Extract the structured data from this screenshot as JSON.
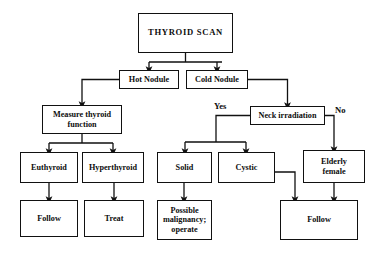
{
  "diagram": {
    "background_color": "#ffffff",
    "line_color": "#111111",
    "text_color": "#0d0d0d",
    "nodes": [
      {
        "id": "thyroid_scan",
        "label": "THYROID SCAN",
        "x": 138,
        "y": 13,
        "w": 95,
        "h": 40,
        "font_size": 8.6,
        "letter_spacing": 0.7
      },
      {
        "id": "hot_nodule",
        "label": "Hot Nodule",
        "x": 119,
        "y": 70,
        "w": 60,
        "h": 19,
        "font_size": 8.2,
        "letter_spacing": 0
      },
      {
        "id": "cold_nodule",
        "label": "Cold Nodule",
        "x": 186,
        "y": 70,
        "w": 62,
        "h": 19,
        "font_size": 8.2,
        "letter_spacing": 0
      },
      {
        "id": "measure_thyroid",
        "label": "Measure thyroid\nfunction",
        "x": 42,
        "y": 105,
        "w": 80,
        "h": 29,
        "font_size": 8.2,
        "letter_spacing": 0
      },
      {
        "id": "neck_irradiation",
        "label": "Neck irradiation",
        "x": 250,
        "y": 106,
        "w": 75,
        "h": 19,
        "font_size": 8.2,
        "letter_spacing": 0
      },
      {
        "id": "euthyroid",
        "label": "Euthyroid",
        "x": 20,
        "y": 152,
        "w": 58,
        "h": 31,
        "font_size": 8.2,
        "letter_spacing": 0
      },
      {
        "id": "hyperthyroid",
        "label": "Hyperthyroid",
        "x": 82,
        "y": 152,
        "w": 62,
        "h": 31,
        "font_size": 8.2,
        "letter_spacing": 0
      },
      {
        "id": "solid",
        "label": "Solid",
        "x": 157,
        "y": 152,
        "w": 55,
        "h": 31,
        "font_size": 8.2,
        "letter_spacing": 0
      },
      {
        "id": "cystic",
        "label": "Cystic",
        "x": 218,
        "y": 152,
        "w": 57,
        "h": 31,
        "font_size": 8.2,
        "letter_spacing": 0
      },
      {
        "id": "elderly_female",
        "label": "Elderly\nfemale",
        "x": 303,
        "y": 150,
        "w": 62,
        "h": 33,
        "font_size": 8.2,
        "letter_spacing": 0
      },
      {
        "id": "follow_euthyroid",
        "label": "Follow",
        "x": 20,
        "y": 200,
        "w": 58,
        "h": 37,
        "font_size": 8.2,
        "letter_spacing": 0
      },
      {
        "id": "treat",
        "label": "Treat",
        "x": 84,
        "y": 200,
        "w": 60,
        "h": 37,
        "font_size": 8.2,
        "letter_spacing": 0
      },
      {
        "id": "possible_malignancy",
        "label": "Possible\nmalignancy;\noperate",
        "x": 157,
        "y": 200,
        "w": 55,
        "h": 40,
        "font_size": 8.2,
        "letter_spacing": 0
      },
      {
        "id": "follow_cystic",
        "label": "Follow",
        "x": 280,
        "y": 200,
        "w": 78,
        "h": 40,
        "font_size": 8.2,
        "letter_spacing": 0
      }
    ],
    "edge_labels": [
      {
        "id": "yes_label",
        "text": "Yes",
        "x": 214,
        "y": 101,
        "font_size": 8.6
      },
      {
        "id": "no_label",
        "text": "No",
        "x": 335,
        "y": 105,
        "font_size": 8.6
      }
    ],
    "edges": [
      {
        "id": "scan-to-hot",
        "from": "thyroid_scan",
        "to": "hot_nodule",
        "path": "M185.5,53 L185.5,62 M149,62 L222,62 M149,62 L149,70"
      },
      {
        "id": "scan-to-cold",
        "from": "thyroid_scan",
        "to": "cold_nodule",
        "path": "M217,62 L217,70"
      },
      {
        "id": "hot-to-measure",
        "from": "hot_nodule",
        "to": "measure_thyroid",
        "path": "M119,79.5 L82,79.5 L82,105"
      },
      {
        "id": "cold-to-neck",
        "from": "cold_nodule",
        "to": "neck_irradiation",
        "path": "M248,79.5 L287.5,79.5 L287.5,106"
      },
      {
        "id": "measure-split",
        "from": "measure_thyroid",
        "to": "euthyroid",
        "path": "M82,134 L82,143 M49,143 L113,143 M49,143 L49,152"
      },
      {
        "id": "measure-to-hyper",
        "from": "measure_thyroid",
        "to": "hyperthyroid",
        "path": "M113,143 L113,152"
      },
      {
        "id": "euthyroid-to-follow",
        "from": "euthyroid",
        "to": "follow_euthyroid",
        "path": "M49,183 L49,200"
      },
      {
        "id": "hyperthyroid-to-treat",
        "from": "hyperthyroid",
        "to": "treat",
        "path": "M114,183 L114,200"
      },
      {
        "id": "neck-yes-branch",
        "from": "neck_irradiation",
        "to": "solid",
        "path": "M250,115.5 L216,115.5 L216,142 M185,142 L246,142 M185,142 L185,152"
      },
      {
        "id": "neck-yes-to-cystic",
        "from": "neck_irradiation",
        "to": "cystic",
        "path": "M246,142 L246,152"
      },
      {
        "id": "neck-no-branch",
        "from": "neck_irradiation",
        "to": "elderly_female",
        "path": "M325,115.5 L334,115.5 L334,150"
      },
      {
        "id": "solid-to-malignancy",
        "from": "solid",
        "to": "possible_malignancy",
        "path": "M184,183 L184,200"
      },
      {
        "id": "cystic-to-follow",
        "from": "cystic",
        "to": "follow_cystic",
        "path": "M275,172 L295,172 L295,200"
      },
      {
        "id": "elderly-to-follow",
        "from": "elderly_female",
        "to": "follow_cystic",
        "path": "M334,183 L334,200"
      }
    ]
  }
}
